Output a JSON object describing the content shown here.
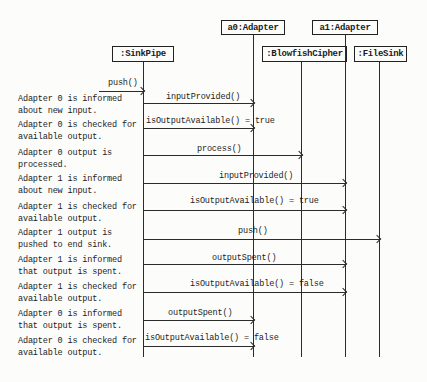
{
  "diagram": {
    "type": "uml-sequence-diagram",
    "colors": {
      "ink": "#2b2b2b",
      "background": "#fcfcfa"
    },
    "objects": [
      {
        "id": "a0",
        "label": "a0:Adapter"
      },
      {
        "id": "a1",
        "label": "a1:Adapter"
      },
      {
        "id": "sinkpipe",
        "label": ":SinkPipe"
      },
      {
        "id": "blowfish",
        "label": ":BlowfishCipher"
      },
      {
        "id": "filesink",
        "label": ":FileSink"
      }
    ],
    "messages": [
      {
        "label": "push()",
        "from": "external",
        "to": ":SinkPipe"
      },
      {
        "label": "inputProvided()",
        "from": ":SinkPipe",
        "to": "a0:Adapter"
      },
      {
        "label": "isOutputAvailable() = true",
        "from": ":SinkPipe",
        "to": "a0:Adapter"
      },
      {
        "label": "process()",
        "from": ":SinkPipe",
        "to": ":BlowfishCipher"
      },
      {
        "label": "inputProvided()",
        "from": ":SinkPipe",
        "to": "a1:Adapter"
      },
      {
        "label": "isOutputAvailable() = true",
        "from": ":SinkPipe",
        "to": "a1:Adapter"
      },
      {
        "label": "push()",
        "from": ":SinkPipe",
        "to": ":FileSink"
      },
      {
        "label": "outputSpent()",
        "from": ":SinkPipe",
        "to": "a1:Adapter"
      },
      {
        "label": "isOutputAvailable() = false",
        "from": ":SinkPipe",
        "to": "a1:Adapter"
      },
      {
        "label": "outputSpent()",
        "from": ":SinkPipe",
        "to": "a0:Adapter"
      },
      {
        "label": "isOutputAvailable() = false",
        "from": ":SinkPipe",
        "to": "a0:Adapter"
      }
    ],
    "annotations": [
      {
        "line1": "Adapter 0 is informed",
        "line2": "about new input."
      },
      {
        "line1": "Adapter 0 is checked for",
        "line2": "available output."
      },
      {
        "line1": "Adapter 0 output is",
        "line2": "processed."
      },
      {
        "line1": "Adapter 1 is informed",
        "line2": "about new input."
      },
      {
        "line1": "Adapter 1 is checked for",
        "line2": "available output."
      },
      {
        "line1": "Adapter 1 output is",
        "line2": "pushed to end sink."
      },
      {
        "line1": "Adapter 1 is informed",
        "line2": "that output is spent."
      },
      {
        "line1": "Adapter 1 is checked for",
        "line2": "available output."
      },
      {
        "line1": "Adapter 0 is informed",
        "line2": "that output is spent."
      },
      {
        "line1": "Adapter 0 is checked for",
        "line2": "available output."
      }
    ]
  }
}
